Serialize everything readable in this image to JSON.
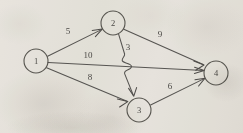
{
  "diagram": {
    "background_color": "#f2f0ec",
    "ink_color": "#565451",
    "nodes": [
      {
        "id": "1",
        "label": "1",
        "cx": 36,
        "cy": 61,
        "r": 12
      },
      {
        "id": "2",
        "label": "2",
        "cx": 113,
        "cy": 23,
        "r": 12
      },
      {
        "id": "3",
        "label": "3",
        "cx": 139,
        "cy": 110,
        "r": 12
      },
      {
        "id": "4",
        "label": "4",
        "cx": 216,
        "cy": 73,
        "r": 12
      }
    ],
    "edges": [
      {
        "id": "e1-2",
        "from": "1",
        "to": "2",
        "weight": "5",
        "label_x": 68,
        "label_y": 32
      },
      {
        "id": "e1-4",
        "from": "1",
        "to": "4",
        "weight": "10",
        "label_x": 88,
        "label_y": 56
      },
      {
        "id": "e1-3",
        "from": "1",
        "to": "3",
        "weight": "8",
        "label_x": 90,
        "label_y": 78
      },
      {
        "id": "e2-3",
        "from": "2",
        "to": "3",
        "weight": "3",
        "label_x": 128,
        "label_y": 48,
        "has_crossing_hop": true
      },
      {
        "id": "e2-4",
        "from": "2",
        "to": "4",
        "weight": "9",
        "label_x": 160,
        "label_y": 35
      },
      {
        "id": "e3-4",
        "from": "3",
        "to": "4",
        "weight": "6",
        "label_x": 170,
        "label_y": 87
      }
    ],
    "weights": {
      "e1_2": "5",
      "e1_4": "10",
      "e1_3": "8",
      "e2_3": "3",
      "e2_4": "9",
      "e3_4": "6"
    },
    "node_labels": {
      "n1": "1",
      "n2": "2",
      "n3": "3",
      "n4": "4"
    }
  }
}
